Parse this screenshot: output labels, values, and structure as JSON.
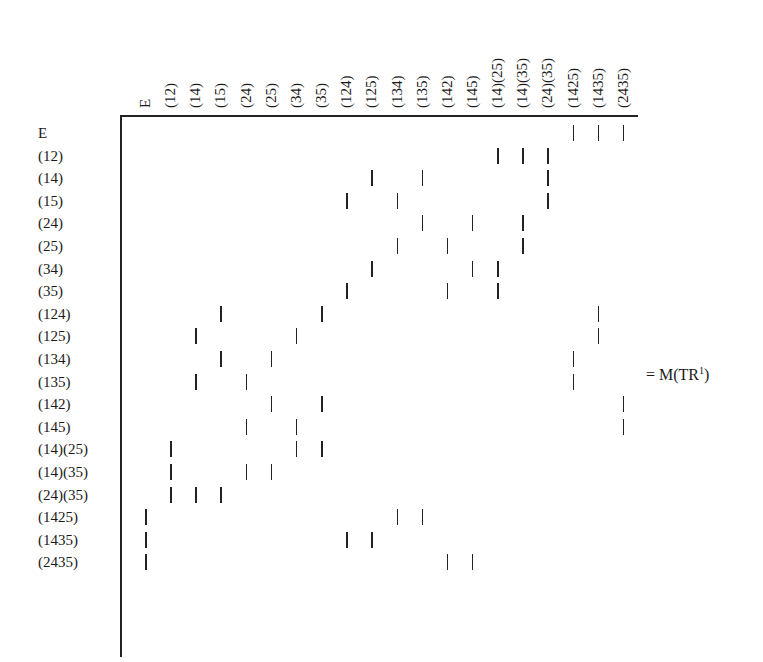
{
  "matrix": {
    "columns": [
      "E",
      "(12)",
      "(14)",
      "(15)",
      "(24)",
      "(25)",
      "(34)",
      "(35)",
      "(124)",
      "(125)",
      "(134)",
      "(135)",
      "(142)",
      "(145)",
      "(14)(25)",
      "(14)(35)",
      "(24)(35)",
      "(1425)",
      "(1435)",
      "(2435)"
    ],
    "rows": [
      "E",
      "(12)",
      "(14)",
      "(15)",
      "(24)",
      "(25)",
      "(34)",
      "(35)",
      "(124)",
      "(125)",
      "(134)",
      "(135)",
      "(142)",
      "(145)",
      "(14)(25)",
      "(14)(35)",
      "(24)(35)",
      "(1425)",
      "(1435)",
      "(2435)"
    ],
    "entries": [
      [
        17,
        18,
        19
      ],
      [
        14,
        15,
        16
      ],
      [
        9,
        11,
        16
      ],
      [
        8,
        10,
        16
      ],
      [
        11,
        13,
        15
      ],
      [
        10,
        12,
        15
      ],
      [
        9,
        13,
        14
      ],
      [
        8,
        12,
        14
      ],
      [
        3,
        7,
        18
      ],
      [
        2,
        6,
        18
      ],
      [
        3,
        5,
        17
      ],
      [
        2,
        4,
        17
      ],
      [
        5,
        7,
        19
      ],
      [
        4,
        6,
        19
      ],
      [
        1,
        6,
        7
      ],
      [
        1,
        4,
        5
      ],
      [
        1,
        2,
        3
      ],
      [
        0,
        10,
        11
      ],
      [
        0,
        8,
        9
      ],
      [
        0,
        12,
        13
      ]
    ],
    "mark_symbol": "|"
  },
  "equation": {
    "prefix": "= M(TR",
    "superscript": "1",
    "suffix": ")"
  }
}
